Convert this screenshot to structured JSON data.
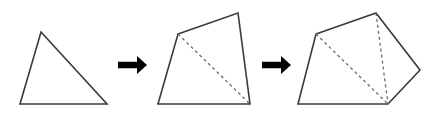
{
  "figure": {
    "background_color": "#ffffff",
    "stroke_color": "#3a3a3a",
    "dashed_color": "#6b6b6b",
    "arrow_color": "#000000",
    "width": 446,
    "height": 114,
    "stages": [
      {
        "name": "triangle",
        "sides": 3,
        "diagonals": 0,
        "triangles": 1,
        "outline_points": "41,32 107,104 20,104",
        "dashed_segments": []
      },
      {
        "name": "quadrilateral",
        "sides": 4,
        "diagonals": 1,
        "triangles": 2,
        "outline_points": "178,34 238,13 250,104 158,104",
        "dashed_segments": [
          {
            "x1": 178,
            "y1": 34,
            "x2": 250,
            "y2": 104
          }
        ]
      },
      {
        "name": "pentagon",
        "sides": 5,
        "diagonals": 2,
        "triangles": 3,
        "outline_points": "316,34 376,13 420,70 388,104 298,104",
        "dashed_segments": [
          {
            "x1": 316,
            "y1": 34,
            "x2": 388,
            "y2": 104
          },
          {
            "x1": 376,
            "y1": 13,
            "x2": 388,
            "y2": 104
          }
        ]
      }
    ],
    "arrows": [
      {
        "name": "arrow-1",
        "label": "arrow-right-icon",
        "x1": 118,
        "y1": 65,
        "x2": 147,
        "y2": 65
      },
      {
        "name": "arrow-2",
        "label": "arrow-right-icon",
        "x1": 262,
        "y1": 65,
        "x2": 291,
        "y2": 65
      }
    ]
  }
}
